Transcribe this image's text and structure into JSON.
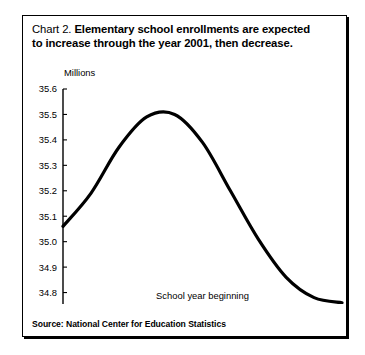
{
  "chart": {
    "title_prefix": "Chart 2.",
    "title_main_line1": "Elementary school enrollments are expected",
    "title_main_line2": "to increase through the year 2001, then decrease.",
    "source": "Source: National Center for Education Statistics"
  },
  "chart_data": {
    "type": "line",
    "title": "Chart 2.  Elementary school enrollments are expected to increase through the year 2001, then decrease.",
    "xlabel": "School year beginning",
    "ylabel": "Millions",
    "units_label": "Millions",
    "x": [
      1998,
      1999,
      2000,
      2001,
      2002,
      2003,
      2004,
      2005,
      2006,
      2007,
      2008
    ],
    "values": [
      35.06,
      35.19,
      35.37,
      35.49,
      35.5,
      35.39,
      35.2,
      35.01,
      34.86,
      34.78,
      34.76
    ],
    "series": [
      {
        "name": "Elementary school enrollment",
        "values": [
          35.06,
          35.19,
          35.37,
          35.49,
          35.5,
          35.39,
          35.2,
          35.01,
          34.86,
          34.78,
          34.76
        ]
      }
    ],
    "xticklabels": [
      "1998",
      "1999",
      "2000",
      "2001",
      "2002",
      "2003",
      "2004",
      "2005",
      "2006",
      "2007",
      "2008"
    ],
    "yticklabels": [
      "35.6",
      "35.5",
      "35.4",
      "35.3",
      "35.2",
      "35.1",
      "35.0",
      "34.9",
      "34.8",
      "34.7"
    ],
    "yticks": [
      35.6,
      35.5,
      35.4,
      35.3,
      35.2,
      35.1,
      35.0,
      34.9,
      34.8,
      34.7
    ],
    "ylim": [
      34.7,
      35.6
    ],
    "xlim": [
      1998,
      2008
    ],
    "grid": false,
    "legend": false,
    "line_color": "#000000"
  }
}
